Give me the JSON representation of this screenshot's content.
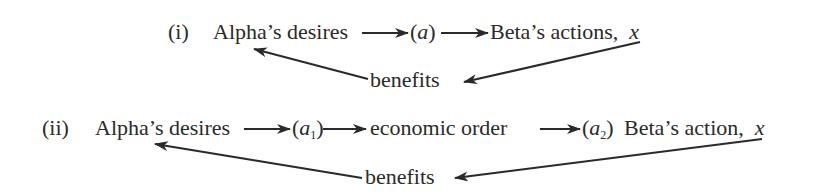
{
  "diagram": {
    "row1": {
      "label": "(i)",
      "source": "Alpha’s desires",
      "mediator": "(a)",
      "mediator_open": "(",
      "mediator_var": "a",
      "mediator_close": ")",
      "target": "Beta’s actions,",
      "target_var": "x",
      "feedback": "benefits"
    },
    "row2": {
      "label": "(ii)",
      "source": "Alpha’s desires",
      "mediator1_open": "(",
      "mediator1_var": "a",
      "mediator1_sub": "1",
      "mediator1_close": ")",
      "middle": "economic order",
      "mediator2_open": "(",
      "mediator2_var": "a",
      "mediator2_sub": "2",
      "mediator2_close": ")",
      "target": "Beta’s action,",
      "target_var": "x",
      "feedback": "benefits"
    },
    "colors": {
      "ink": "#2a2a2a",
      "background": "#ffffff"
    }
  }
}
